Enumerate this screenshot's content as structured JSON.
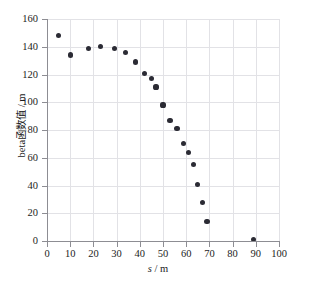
{
  "chart_data": {
    "type": "scatter",
    "title": "",
    "xlabel": "s / m",
    "ylabel": "beta函数值 / m",
    "xlim": [
      0,
      100
    ],
    "ylim": [
      0,
      160
    ],
    "xticks": [
      0,
      10,
      20,
      30,
      40,
      50,
      60,
      70,
      80,
      90,
      100
    ],
    "yticks": [
      0,
      20,
      40,
      60,
      80,
      100,
      120,
      140,
      160
    ],
    "grid": true,
    "legend": null,
    "marker_color": "#2b2b34",
    "grid_color": "#e2e2e6",
    "axis_color": "#8d8d93",
    "series": [
      {
        "name": "beta function",
        "x": [
          5,
          10,
          18,
          23,
          29,
          34,
          38,
          42,
          45,
          47,
          50,
          53,
          56,
          59,
          61,
          63,
          65,
          67,
          69,
          89
        ],
        "y": [
          148,
          134,
          139,
          140,
          139,
          136,
          129,
          121,
          117,
          111,
          98,
          87,
          81,
          70,
          64,
          55,
          41,
          28,
          14,
          1
        ]
      }
    ]
  },
  "axis": {
    "x_title_var": "s",
    "x_title_sep": " / ",
    "x_title_unit": "m",
    "y_title": "beta函数值 / m"
  }
}
